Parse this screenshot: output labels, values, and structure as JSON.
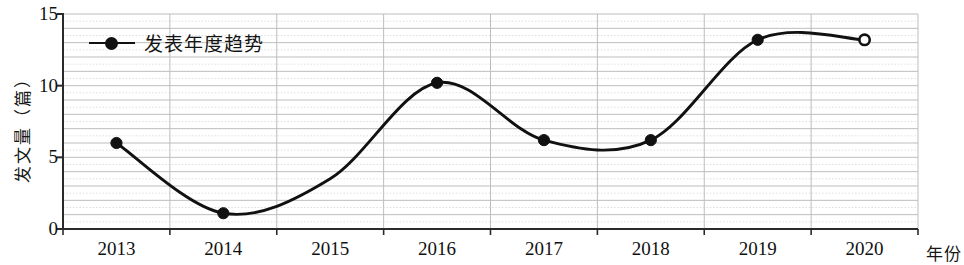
{
  "chart_data": {
    "type": "line",
    "title": "",
    "subtitle": "",
    "xlabel": "年份",
    "ylabel": "发文量（篇）",
    "categories": [
      "2013",
      "2014",
      "2015",
      "2016",
      "2017",
      "2018",
      "2019",
      "2020"
    ],
    "series": [
      {
        "name": "发表年度趋势",
        "values": [
          6.0,
          1.1,
          3.5,
          10.2,
          6.2,
          6.2,
          13.2,
          13.2
        ],
        "marker": "circle",
        "marker_filled": [
          true,
          true,
          false,
          true,
          true,
          true,
          true,
          false
        ],
        "line_color": "#111111",
        "smoothed": true
      }
    ],
    "xlim": [
      2012.5,
      2020.5
    ],
    "ylim": [
      0,
      15
    ],
    "ytick_labels": [
      "0",
      "5",
      "10",
      "15"
    ],
    "ytick_values": [
      0,
      5,
      10,
      15
    ],
    "xtick_labels": [
      "2013",
      "2014",
      "2015",
      "2016",
      "2017",
      "2018",
      "2019",
      "2020"
    ],
    "grid": true,
    "grid_minor_step": 0.5,
    "grid_major_step": 1,
    "legend_position": "top-left-inside",
    "legend_entries": [
      "发表年度趋势"
    ],
    "annotations": []
  },
  "axes": {
    "y_title": "发文量（篇）",
    "x_title": "年份",
    "y_ticks": [
      "15",
      "10",
      "5",
      "0"
    ],
    "x_ticks": [
      "2013",
      "2014",
      "2015",
      "2016",
      "2017",
      "2018",
      "2019",
      "2020"
    ]
  },
  "legend": {
    "label": "发表年度趋势"
  },
  "colors": {
    "line": "#111111",
    "grid_major": "#bdbdbd",
    "grid_minor": "#dedede",
    "axis": "#2a2a2a",
    "background": "#ffffff"
  }
}
